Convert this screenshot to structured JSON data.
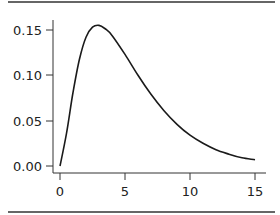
{
  "chart_data": {
    "type": "line",
    "title": "",
    "xlabel": "",
    "ylabel": "",
    "xlim": [
      0,
      15
    ],
    "ylim": [
      0,
      0.15
    ],
    "grid": false,
    "legend": null,
    "x_ticks": [
      "0",
      "5",
      "10",
      "15"
    ],
    "y_ticks": [
      "0.00",
      "0.05",
      "0.10",
      "0.15"
    ],
    "series": [
      {
        "name": "density",
        "x": [
          0,
          0.5,
          1,
          1.5,
          2,
          2.5,
          3,
          3.5,
          4,
          5,
          6,
          7,
          8,
          9,
          10,
          11,
          12,
          13,
          14,
          15
        ],
        "y": [
          0.0,
          0.036,
          0.081,
          0.118,
          0.142,
          0.153,
          0.155,
          0.151,
          0.144,
          0.123,
          0.1,
          0.079,
          0.061,
          0.046,
          0.034,
          0.025,
          0.018,
          0.013,
          0.009,
          0.007
        ]
      }
    ]
  },
  "colors": {
    "line": "#1a1a1a",
    "axis": "#333333",
    "rule": "#333333"
  }
}
